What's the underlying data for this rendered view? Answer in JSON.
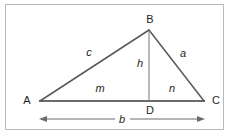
{
  "figure": {
    "background_color": "#ffffff",
    "frame_color": "#b9b9bb",
    "stroke_color": "#6b6b6b",
    "label_color": "#231f20",
    "vertices": [
      {
        "name": "A",
        "label": "A",
        "x": 40,
        "y": 101,
        "label_x": 27,
        "label_y": 100
      },
      {
        "name": "B",
        "label": "B",
        "x": 149,
        "y": 30,
        "label_x": 150,
        "label_y": 19
      },
      {
        "name": "C",
        "label": "C",
        "x": 204,
        "y": 101,
        "label_x": 216,
        "label_y": 100
      },
      {
        "name": "D",
        "label": "D",
        "x": 149,
        "y": 101,
        "label_x": 150,
        "label_y": 110
      }
    ],
    "segments": [
      {
        "name": "side-c",
        "label": "c",
        "from": "A",
        "to": "B",
        "label_x": 89,
        "label_y": 52
      },
      {
        "name": "side-a",
        "label": "a",
        "from": "B",
        "to": "C",
        "label_x": 183,
        "label_y": 53
      },
      {
        "name": "side-b",
        "label": "b",
        "from": "A",
        "to": "C",
        "label_x": 122,
        "label_y": 119
      },
      {
        "name": "altitude-h",
        "label": "h",
        "from": "B",
        "to": "D",
        "label_x": 140,
        "label_y": 63
      },
      {
        "name": "segment-m",
        "label": "m",
        "from": "A",
        "to": "D",
        "label_x": 100,
        "label_y": 88
      },
      {
        "name": "segment-n",
        "label": "n",
        "from": "D",
        "to": "C",
        "label_x": 172,
        "label_y": 88
      }
    ],
    "dimension": {
      "name": "base-dimension",
      "label": "b",
      "x1": 40,
      "x2": 204,
      "y": 119,
      "double_headed": true
    }
  }
}
